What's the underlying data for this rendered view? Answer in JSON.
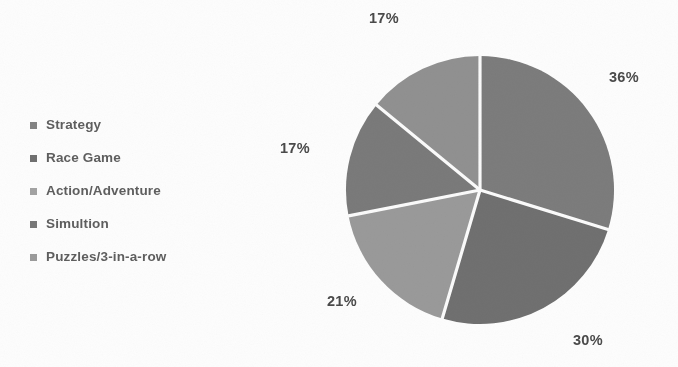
{
  "chart_data": {
    "type": "pie",
    "title": "",
    "subtitle": "",
    "xlabel": "",
    "ylabel": "",
    "grid": false,
    "legend_position": "left",
    "start_angle_deg": 0,
    "direction": "clockwise",
    "units": "percent",
    "categories": [
      "Strategy",
      "Race Game",
      "Action/Adventure",
      "Simultion",
      "Puzzles/3-in-a-row"
    ],
    "values": [
      36,
      30,
      21,
      17,
      17
    ],
    "labels": [
      "36%",
      "30%",
      "21%",
      "17%",
      "17%"
    ],
    "colors": [
      "#7b7b7b",
      "#6f6f6f",
      "#9a9a9a",
      "#7a7a7a",
      "#919191"
    ],
    "separator_color": "#fbfbfb",
    "slices": [
      {
        "name": "Strategy",
        "value": 36,
        "label": "36%",
        "color": "#7b7b7b"
      },
      {
        "name": "Race Game",
        "value": 30,
        "label": "30%",
        "color": "#6f6f6f"
      },
      {
        "name": "Action/Adventure",
        "value": 21,
        "label": "21%",
        "color": "#9a9a9a"
      },
      {
        "name": "Simultion",
        "value": 17,
        "label": "17%",
        "color": "#7a7a7a"
      },
      {
        "name": "Puzzles/3-in-a-row",
        "value": 17,
        "label": "17%",
        "color": "#919191"
      }
    ]
  },
  "legend": {
    "items": [
      {
        "label": "Strategy",
        "bullet_color": "#828282"
      },
      {
        "label": "Race Game",
        "bullet_color": "#6f6f6f"
      },
      {
        "label": "Action/Adventure",
        "bullet_color": "#a2a2a2"
      },
      {
        "label": "Simultion",
        "bullet_color": "#777777"
      },
      {
        "label": "Puzzles/3-in-a-row",
        "bullet_color": "#9a9a9a"
      }
    ]
  },
  "pct_labels": {
    "strategy": "36%",
    "race": "30%",
    "action": "21%",
    "simulation": "17%",
    "puzzles": "17%"
  }
}
